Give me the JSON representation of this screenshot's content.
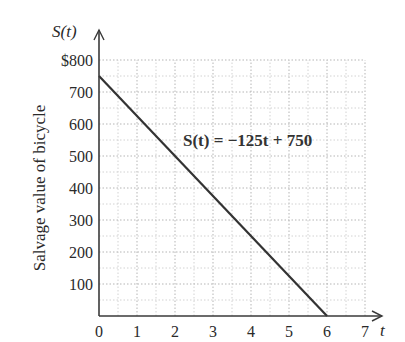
{
  "chart_data": {
    "type": "line",
    "title": "",
    "xlabel": "t",
    "ylabel": "Salvage value of bicycle",
    "y_axis_name": "S(t)",
    "xlim": [
      0,
      7
    ],
    "ylim": [
      0,
      800
    ],
    "x_ticks": [
      "0",
      "1",
      "2",
      "3",
      "4",
      "5",
      "6",
      "7"
    ],
    "y_ticks": [
      "100",
      "200",
      "300",
      "400",
      "500",
      "600",
      "700",
      "$800"
    ],
    "y_tick_values": [
      100,
      200,
      300,
      400,
      500,
      600,
      700,
      800
    ],
    "grid": true,
    "grid_style": "dotted, minor lines every 0.5 on x and every 50 on y",
    "series": [
      {
        "name": "S(t) = -125t + 750",
        "x": [
          0,
          6
        ],
        "values": [
          750,
          0
        ]
      }
    ],
    "annotations": [
      {
        "text": "S(t) = −125t + 750",
        "x": 3.0,
        "y": 560
      }
    ],
    "legend": "none",
    "line_color": "#333333"
  },
  "labels": {
    "y_axis_name": "S(t)",
    "x_axis_name": "t",
    "ylabel": "Salvage value of bicycle",
    "equation": "S(t) = −125t + 750"
  }
}
